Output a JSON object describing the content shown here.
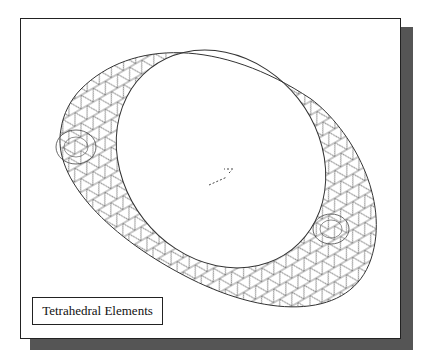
{
  "figure": {
    "label": "Tetrahedral Elements",
    "colors": {
      "frame": "#222222",
      "shadow": "#555555",
      "mesh": "#333333",
      "background": "#ffffff"
    }
  }
}
